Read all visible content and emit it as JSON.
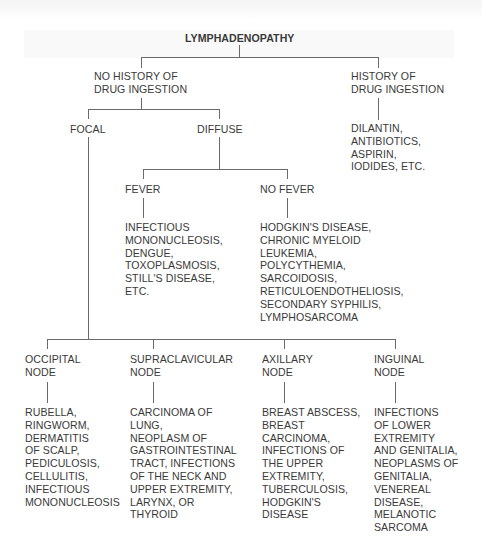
{
  "diagram": {
    "title": "LYMPHADENOPATHY",
    "branches": {
      "no_history": {
        "label": "NO HISTORY OF\nDRUG INGESTION",
        "focal": {
          "label": "FOCAL",
          "nodes": [
            {
              "label": "OCCIPITAL\nNODE",
              "causes": "RUBELLA,\nRINGWORM,\nDERMATITIS\nOF SCALP,\nPEDICULOSIS,\nCELLULITIS,\nINFECTIOUS\nMONONUCLEOSIS"
            },
            {
              "label": "SUPRACLAVICULAR\nNODE",
              "causes": "CARCINOMA OF\nLUNG,\nNEOPLASM OF\nGASTROINTESTINAL\nTRACT, INFECTIONS\nOF THE NECK AND\nUPPER EXTREMITY,\nLARYNX, OR\nTHYROID"
            },
            {
              "label": "AXILLARY\nNODE",
              "causes": "BREAST ABSCESS,\nBREAST\nCARCINOMA,\nINFECTIONS OF\nTHE UPPER\nEXTREMITY,\nTUBERCULOSIS,\nHODGKIN'S\nDISEASE"
            },
            {
              "label": "INGUINAL\nNODE",
              "causes": "INFECTIONS\nOF LOWER\nEXTREMITY\nAND GENITALIA,\nNEOPLASMS OF\nGENITALIA,\nVENEREAL\nDISEASE,\nMELANOTIC\nSARCOMA"
            }
          ]
        },
        "diffuse": {
          "label": "DIFFUSE",
          "fever": {
            "label": "FEVER",
            "causes": "INFECTIOUS\nMONONUCLEOSIS,\nDENGUE,\nTOXOPLASMOSIS,\nSTILL'S DISEASE,\nETC."
          },
          "no_fever": {
            "label": "NO FEVER",
            "causes": "HODGKIN'S DISEASE,\nCHRONIC MYELOID\nLEUKEMIA,\nPOLYCYTHEMIA,\nSARCOIDOSIS,\nRETICULOENDOTHELIOSIS,\nSECONDARY SYPHILIS,\nLYMPHOSARCOMA"
          }
        }
      },
      "history": {
        "label": "HISTORY OF\nDRUG INGESTION",
        "causes": "DILANTIN,\nANTIBIOTICS,\nASPIRIN,\nIODIDES, ETC."
      }
    }
  }
}
